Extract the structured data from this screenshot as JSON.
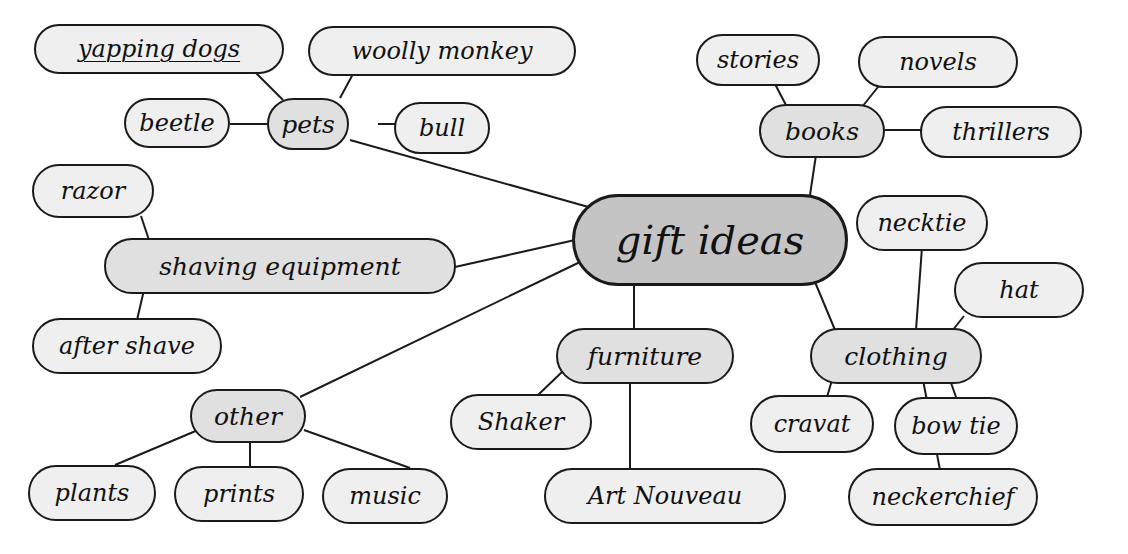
{
  "diagram": {
    "type": "mind-map",
    "root": {
      "id": "gift-ideas",
      "label": "gift ideas"
    },
    "categories": [
      {
        "id": "pets",
        "label": "pets",
        "children": [
          {
            "id": "yapping-dogs",
            "label": "yapping dogs"
          },
          {
            "id": "woolly-monkey",
            "label": "woolly monkey"
          },
          {
            "id": "beetle",
            "label": "beetle"
          },
          {
            "id": "bull",
            "label": "bull"
          }
        ]
      },
      {
        "id": "books",
        "label": "books",
        "children": [
          {
            "id": "stories",
            "label": "stories"
          },
          {
            "id": "novels",
            "label": "novels"
          },
          {
            "id": "thrillers",
            "label": "thrillers"
          }
        ]
      },
      {
        "id": "shaving-equipment",
        "label": "shaving equipment",
        "children": [
          {
            "id": "razor",
            "label": "razor"
          },
          {
            "id": "after-shave",
            "label": "after shave"
          }
        ]
      },
      {
        "id": "other",
        "label": "other",
        "children": [
          {
            "id": "plants",
            "label": "plants"
          },
          {
            "id": "prints",
            "label": "prints"
          },
          {
            "id": "music",
            "label": "music"
          }
        ]
      },
      {
        "id": "furniture",
        "label": "furniture",
        "children": [
          {
            "id": "shaker",
            "label": "Shaker"
          },
          {
            "id": "art-nouveau",
            "label": "Art Nouveau"
          }
        ]
      },
      {
        "id": "clothing",
        "label": "clothing",
        "children": [
          {
            "id": "necktie",
            "label": "necktie"
          },
          {
            "id": "hat",
            "label": "hat"
          },
          {
            "id": "cravat",
            "label": "cravat"
          },
          {
            "id": "bow-tie",
            "label": "bow tie"
          },
          {
            "id": "neckerchief",
            "label": "neckerchief"
          }
        ]
      }
    ],
    "colors": {
      "root_fill": "#c4c4c4",
      "category_fill": "#e0e0e0",
      "leaf_fill": "#efefef",
      "stroke": "#1a1a1a",
      "background": "#ffffff"
    }
  }
}
